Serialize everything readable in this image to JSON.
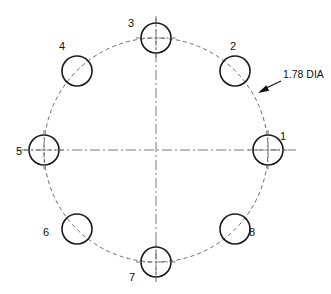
{
  "drawing": {
    "title": "Bolt circle hole pattern",
    "canvas": {
      "width": 331,
      "height": 294,
      "background": "#ffffff"
    },
    "geometry": {
      "center_x": 156,
      "center_y": 150,
      "bolt_circle_radius": 112,
      "hole_radius": 15,
      "hole_count": 8,
      "angular_spacing_degrees": 45,
      "first_hole_angle_degrees": 0
    },
    "styles": {
      "hole_stroke": "#1a1a1a",
      "bolt_circle_stroke": "#6b6b6b",
      "centerline_stroke": "#7a7a7a",
      "leader_stroke": "#111111",
      "text_color": "#111111"
    },
    "centerlines": {
      "horizontal": {
        "x1": 18,
        "y1": 150,
        "x2": 296,
        "y2": 150
      },
      "vertical": {
        "x1": 156,
        "y1": 16,
        "x2": 156,
        "y2": 282
      }
    },
    "holes": [
      {
        "number": "1",
        "angle_degrees": 0,
        "cx": 268,
        "cy": 150,
        "label_x": 283,
        "label_y": 140,
        "has_centerlines": true
      },
      {
        "number": "2",
        "angle_degrees": 45,
        "cx": 235,
        "cy": 71,
        "label_x": 233,
        "label_y": 50,
        "has_centerlines": false
      },
      {
        "number": "3",
        "angle_degrees": 90,
        "cx": 156,
        "cy": 38,
        "label_x": 131,
        "label_y": 27,
        "has_centerlines": true
      },
      {
        "number": "4",
        "angle_degrees": 135,
        "cx": 77,
        "cy": 71,
        "label_x": 62,
        "label_y": 50,
        "has_centerlines": false
      },
      {
        "number": "5",
        "angle_degrees": 180,
        "cx": 44,
        "cy": 150,
        "label_x": 19,
        "label_y": 155,
        "has_centerlines": true
      },
      {
        "number": "6",
        "angle_degrees": 225,
        "cx": 77,
        "cy": 229,
        "label_x": 46,
        "label_y": 236,
        "has_centerlines": false
      },
      {
        "number": "7",
        "angle_degrees": 270,
        "cx": 156,
        "cy": 262,
        "label_x": 132,
        "label_y": 281,
        "has_centerlines": true
      },
      {
        "number": "8",
        "angle_degrees": 315,
        "cx": 235,
        "cy": 229,
        "label_x": 252,
        "label_y": 236,
        "has_centerlines": false
      }
    ],
    "note": {
      "text": "1.78 DIA",
      "text_x": 283,
      "text_y": 78,
      "leader": {
        "x1": 281,
        "y1": 81,
        "x2": 262,
        "y2": 90
      },
      "arrow_tip_x": 258,
      "arrow_tip_y": 93
    }
  }
}
